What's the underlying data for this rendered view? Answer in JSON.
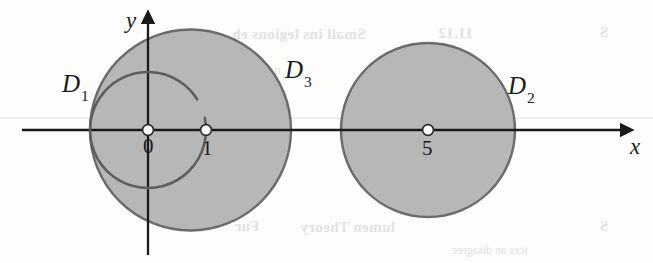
{
  "figure": {
    "kind": "math-diagram",
    "width": 653,
    "height": 263,
    "background_color": "#fdfdfc",
    "disk_fill_color": "#b3b3b3",
    "disk_stroke_color": "#6b6b6b",
    "axis_color": "#1a1a1a",
    "label_color": "#1a1a1a",
    "ghost_color": "#d9d9d9"
  },
  "axes": {
    "x_label": "x",
    "y_label": "y",
    "origin_px": {
      "x": 148,
      "y": 130
    },
    "unit_px": 58,
    "x_axis_y_px": 130,
    "y_axis_x_px": 148,
    "x_range_px": {
      "start": 22,
      "end": 628
    },
    "y_range_px": {
      "start": 16,
      "end": 255
    }
  },
  "tick_points": [
    {
      "name": "origin",
      "label": "0",
      "x_value": 0,
      "px_x": 148,
      "px_y": 130,
      "marker": "open-dot"
    },
    {
      "name": "one",
      "label": "1",
      "x_value": 1,
      "px_x": 206,
      "px_y": 130,
      "marker": "open-dot"
    },
    {
      "name": "five",
      "label": "5",
      "x_value": 5,
      "px_x": 428,
      "px_y": 130,
      "marker": "open-dot"
    }
  ],
  "regions": [
    {
      "id": "D1",
      "label": "D",
      "subscript": "1",
      "boundary": "open",
      "shaded": false,
      "center_value": {
        "x": 0,
        "y": 0
      },
      "radius_value": 1,
      "center_px": {
        "x": 148,
        "y": 130
      },
      "radius_px": 58,
      "arc_gap_deg": {
        "start": -32,
        "end": -12
      },
      "label_px": {
        "x": 62,
        "y": 70
      }
    },
    {
      "id": "D3",
      "label": "D",
      "subscript": "3",
      "boundary": "closed",
      "shaded": true,
      "center_value": {
        "x": 0.73,
        "y": 0
      },
      "radius_value": 1.74,
      "center_px": {
        "x": 190.5,
        "y": 130
      },
      "radius_px": 100.5,
      "label_px": {
        "x": 285,
        "y": 56
      }
    },
    {
      "id": "D2",
      "label": "D",
      "subscript": "2",
      "boundary": "closed",
      "shaded": true,
      "center_value": {
        "x": 5,
        "y": 0
      },
      "radius_value": 1.5,
      "center_px": {
        "x": 428,
        "y": 130
      },
      "radius_px": 87,
      "label_px": {
        "x": 508,
        "y": 72
      }
    }
  ],
  "ghost_artifacts": {
    "note": "faint mirrored show-through text from reverse of printed page",
    "rule_line_y_px": 118,
    "items": [
      {
        "id": "gt-a",
        "text": "Small ins legions eh"
      },
      {
        "id": "gt-b",
        "text": "11.12"
      },
      {
        "id": "gt-c",
        "text": "S"
      },
      {
        "id": "gt-d",
        "text": "nouns"
      },
      {
        "id": "gt-e",
        "text": "aid"
      },
      {
        "id": "gt-f",
        "text": "lumen Theory"
      },
      {
        "id": "gt-g",
        "text": "Fur"
      },
      {
        "id": "gt-h",
        "text": "ices an disagree"
      },
      {
        "id": "gt-i",
        "text": "S"
      }
    ]
  }
}
